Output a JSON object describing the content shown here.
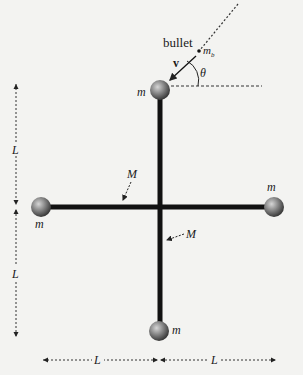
{
  "figure": {
    "type": "rigid-body collision diagram",
    "labels": {
      "bullet": "bullet",
      "bullet_mass": "m",
      "bullet_mass_sub": "b",
      "velocity": "v",
      "angle": "θ",
      "mass_top": "m",
      "mass_left": "m",
      "mass_right": "m",
      "mass_bottom": "m",
      "rod_mass_upper": "M",
      "rod_mass_lower": "M",
      "length_left_upper": "L",
      "length_left_lower": "L",
      "length_bottom_left": "L",
      "length_bottom_right": "L"
    },
    "colors": {
      "background": "#f3f3f1",
      "rod": "#111111",
      "ball_light": "#bdbdbd",
      "ball_dark": "#3a3a3a",
      "dashes": "#333333"
    }
  }
}
